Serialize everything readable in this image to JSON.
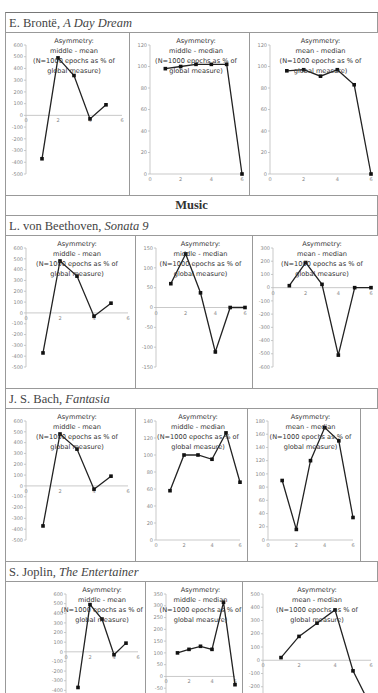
{
  "sections": [
    {
      "type": "label",
      "author": "E. Brontë, ",
      "work": "A Day Dream",
      "row": 0
    },
    {
      "type": "header",
      "text": "Music"
    },
    {
      "type": "label",
      "author": "L. von Beethoven, ",
      "work": "Sonata 9",
      "row": 1
    },
    {
      "type": "label",
      "author": "J. S. Bach, ",
      "work": "Fantasia",
      "row": 2
    },
    {
      "type": "label",
      "author": "S. Joplin, ",
      "work": "The Entertainer",
      "row": 3
    }
  ],
  "rows": [
    {
      "author": "E. Brontë, ",
      "work": "A Day Dream"
    },
    {
      "author": "L. von Beethoven, ",
      "work": "Sonata 9"
    },
    {
      "author": "J. S. Bach, ",
      "work": "Fantasia"
    },
    {
      "author": "S. Joplin, ",
      "work": "The Entertainer"
    }
  ],
  "section_header": "Music",
  "title_lines": {
    "line1": "Asymmetry:",
    "middle_mean": "middle - mean",
    "middle_median": "middle - median",
    "mean_median": "mean - median",
    "line3": "(N=1000 epochs as % of",
    "line4": "global measure)"
  },
  "chart_data": [
    {
      "type": "line",
      "work": "E. Brontë, A Day Dream",
      "title": "Asymmetry: middle - mean (N=1000 epochs as % of global measure)",
      "x": [
        1,
        2,
        3,
        4,
        5
      ],
      "values": [
        -370,
        490,
        340,
        -30,
        90
      ],
      "ylim": [
        -500,
        600
      ],
      "yticks": [
        600,
        500,
        400,
        300,
        200,
        100,
        0,
        -100,
        -200,
        -300,
        -400,
        -500
      ],
      "xticks": [
        0,
        2,
        4,
        6
      ],
      "xlim": [
        0,
        6
      ],
      "grid": false,
      "legend": "none"
    },
    {
      "type": "line",
      "work": "E. Brontë, A Day Dream",
      "title": "Asymmetry: middle - median (N=1000 epochs as % of global measure)",
      "x": [
        1,
        2,
        3,
        4,
        5,
        6
      ],
      "values": [
        98,
        100,
        102,
        102,
        102,
        0
      ],
      "ylim": [
        0,
        120
      ],
      "yticks": [
        120,
        100,
        80,
        60,
        40,
        20,
        0
      ],
      "xticks": [
        0,
        2,
        4,
        6
      ],
      "xlim": [
        0,
        6
      ],
      "grid": false,
      "legend": "none"
    },
    {
      "type": "line",
      "work": "E. Brontë, A Day Dream",
      "title": "Asymmetry: mean - median (N=1000 epochs as % of global measure)",
      "x": [
        1,
        2,
        3,
        4,
        5,
        6
      ],
      "values": [
        96,
        97,
        91,
        97,
        83,
        0
      ],
      "ylim": [
        0,
        120
      ],
      "yticks": [
        120,
        100,
        80,
        60,
        40,
        20,
        0
      ],
      "xticks": [
        0,
        2,
        4,
        6
      ],
      "xlim": [
        0,
        6
      ],
      "grid": false,
      "legend": "none"
    },
    {
      "type": "line",
      "work": "L. von Beethoven, Sonata 9",
      "title": "Asymmetry: middle - mean (N=1000 epochs as % of global measure)",
      "x": [
        1,
        2,
        3,
        4,
        5
      ],
      "values": [
        -370,
        480,
        340,
        -30,
        90
      ],
      "ylim": [
        -500,
        600
      ],
      "yticks": [
        600,
        500,
        400,
        300,
        200,
        100,
        0,
        -100,
        -200,
        -300,
        -400,
        -500
      ],
      "xticks": [
        0,
        2,
        4,
        6
      ],
      "xlim": [
        0,
        6
      ],
      "grid": false,
      "legend": "none"
    },
    {
      "type": "line",
      "work": "L. von Beethoven, Sonata 9",
      "title": "Asymmetry: middle - median (N=1000 epochs as % of global measure)",
      "x": [
        1,
        2,
        3,
        4,
        5,
        6
      ],
      "values": [
        60,
        135,
        37,
        -112,
        0,
        0
      ],
      "ylim": [
        -150,
        150
      ],
      "yticks": [
        150,
        100,
        50,
        0,
        -50,
        -100,
        -150
      ],
      "xticks": [
        0,
        2,
        4,
        6
      ],
      "xlim": [
        0,
        6
      ],
      "grid": false,
      "legend": "none"
    },
    {
      "type": "line",
      "work": "L. von Beethoven, Sonata 9",
      "title": "Asymmetry: mean - median (N=1000 epochs as % of global measure)",
      "x": [
        1,
        2,
        3,
        4,
        5,
        6
      ],
      "values": [
        15,
        190,
        25,
        -510,
        0,
        0
      ],
      "ylim": [
        -600,
        300
      ],
      "yticks": [
        300,
        200,
        100,
        0,
        -100,
        -200,
        -300,
        -400,
        -500,
        -600
      ],
      "xticks": [
        0,
        2,
        4,
        6
      ],
      "xlim": [
        0,
        6
      ],
      "grid": false,
      "legend": "none"
    },
    {
      "type": "line",
      "work": "J. S. Bach, Fantasia",
      "title": "Asymmetry: middle - mean (N=1000 epochs as % of global measure)",
      "x": [
        1,
        2,
        3,
        4,
        5
      ],
      "values": [
        -370,
        480,
        340,
        -30,
        90
      ],
      "ylim": [
        -500,
        600
      ],
      "yticks": [
        600,
        500,
        400,
        300,
        200,
        100,
        0,
        -100,
        -200,
        -300,
        -400,
        -500
      ],
      "xticks": [
        0,
        2,
        4,
        6
      ],
      "xlim": [
        0,
        6
      ],
      "grid": false,
      "legend": "none"
    },
    {
      "type": "line",
      "work": "J. S. Bach, Fantasia",
      "title": "Asymmetry: middle - median (N=1000 epochs as % of global measure)",
      "x": [
        1,
        2,
        3,
        4,
        5,
        6
      ],
      "values": [
        58,
        100,
        100,
        95,
        126,
        68
      ],
      "ylim": [
        0,
        140
      ],
      "yticks": [
        140,
        120,
        100,
        80,
        60,
        40,
        20,
        0
      ],
      "xticks": [
        0,
        2,
        4,
        6
      ],
      "xlim": [
        0,
        6
      ],
      "grid": false,
      "legend": "none"
    },
    {
      "type": "line",
      "work": "J. S. Bach, Fantasia",
      "title": "Asymmetry: mean - median (N=1000 epochs as % of global measure)",
      "x": [
        1,
        2,
        3,
        4,
        5,
        6
      ],
      "values": [
        90,
        16,
        120,
        170,
        150,
        34
      ],
      "ylim": [
        0,
        180
      ],
      "yticks": [
        180,
        160,
        140,
        120,
        100,
        80,
        60,
        40,
        20,
        0
      ],
      "xticks": [
        0,
        2,
        4,
        6
      ],
      "xlim": [
        0,
        6
      ],
      "grid": false,
      "legend": "none"
    },
    {
      "type": "line",
      "work": "S. Joplin, The Entertainer",
      "title": "Asymmetry: middle - mean (N=1000 epochs as % of global measure)",
      "x": [
        1,
        2,
        3,
        4,
        5
      ],
      "values": [
        -370,
        490,
        340,
        -30,
        90
      ],
      "ylim": [
        -500,
        600
      ],
      "yticks": [
        600,
        500,
        400,
        300,
        200,
        100,
        0,
        -100,
        -200,
        -300,
        -400,
        -500
      ],
      "xticks": [
        0,
        2,
        4,
        6
      ],
      "xlim": [
        0,
        6
      ],
      "grid": false,
      "legend": "none"
    },
    {
      "type": "line",
      "work": "S. Joplin, The Entertainer",
      "title": "Asymmetry: middle - median (N=1000 epochs as % of global measure)",
      "x": [
        1,
        2,
        3,
        4,
        5,
        6
      ],
      "values": [
        100,
        115,
        128,
        115,
        315,
        -35
      ],
      "ylim": [
        -100,
        350
      ],
      "yticks": [
        350,
        300,
        250,
        200,
        150,
        100,
        50,
        0,
        -50,
        -100
      ],
      "xticks": [
        0,
        2,
        4,
        6
      ],
      "xlim": [
        0,
        6
      ],
      "grid": false,
      "legend": "none"
    },
    {
      "type": "line",
      "work": "S. Joplin, The Entertainer",
      "title": "Asymmetry: mean - median (N=1000 epochs as % of global measure)",
      "x": [
        1,
        2,
        3,
        4,
        5,
        6
      ],
      "values": [
        20,
        180,
        280,
        380,
        -80,
        -350
      ],
      "ylim": [
        -300,
        500
      ],
      "yticks": [
        500,
        400,
        300,
        200,
        100,
        0,
        -100,
        -200,
        -300
      ],
      "xticks": [
        0,
        2,
        4,
        6
      ],
      "xlim": [
        0,
        6
      ],
      "grid": false,
      "legend": "none"
    }
  ]
}
